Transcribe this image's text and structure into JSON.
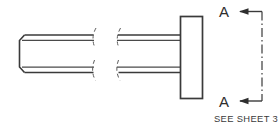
{
  "drawing": {
    "title": "Shaft with end flange - side elevation",
    "canvas": {
      "width": 278,
      "height": 131,
      "background": "#ffffff"
    },
    "line_color": "#3a3a3a",
    "break_line_color": "#5c5c5c",
    "text_color": "#2e2e2e",
    "view_type": "side elevation with conventional break"
  },
  "section": {
    "letter_top": "A",
    "letter_bottom": "A",
    "arrow_direction": "left",
    "cut_line_style": "dash-dot center line",
    "note": "SEE SHEET 3"
  },
  "geometry": {
    "left_segment": {
      "name": "chamfered-left-end",
      "top_edge_y": 35,
      "bottom_edge_y": 72,
      "chamfer": "angled corner cut at left end, top and bottom"
    },
    "right_segment": {
      "name": "shaft-to-flange",
      "top_edge_y": 35,
      "bottom_edge_y": 72
    },
    "flange": {
      "name": "end-flange-rectangle",
      "x": 180,
      "y": 16,
      "width": 22,
      "height": 82
    },
    "break_left_x": 93,
    "break_right_x": 118
  }
}
